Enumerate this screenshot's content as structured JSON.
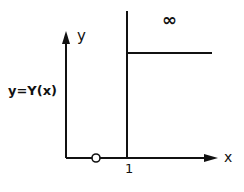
{
  "diagram": {
    "y_axis_label": "y",
    "x_axis_label": "x",
    "function_label": "y=Υ(x)",
    "tick_label_1": "1",
    "infinity_label": "∞",
    "origin_marker": "open-circle",
    "colors": {
      "ink": "#111111",
      "background": "#ffffff"
    }
  }
}
